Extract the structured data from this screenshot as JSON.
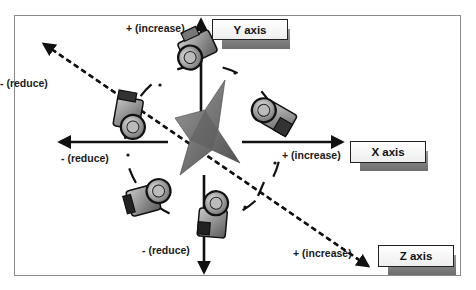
{
  "diagram": {
    "axes": [
      {
        "id": "y",
        "label": "Y axis",
        "positive": "+ (increase)",
        "negative": "- (reduce)"
      },
      {
        "id": "x",
        "label": "X axis",
        "positive": "+ (increase)",
        "negative": "- (reduce)"
      },
      {
        "id": "z",
        "label": "Z axis",
        "positive": "+ (increase)",
        "negative": "- (reduce)"
      }
    ],
    "labels": {
      "y_plus": "+ (increase)",
      "z_minus": "- (reduce)",
      "x_minus": "- (reduce)",
      "x_plus": "+ (increase)",
      "y_minus": "- (reduce)",
      "z_plus": "+ (increase)"
    },
    "colors": {
      "axis_line": "#111111",
      "frame": "#8a8a8a",
      "camera_body": "#8c8c8c",
      "star": "#7a7a7a"
    },
    "cameras": 6
  }
}
